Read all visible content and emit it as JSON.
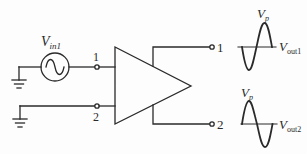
{
  "diagram": {
    "type": "amplifier-differential-output",
    "colors": {
      "stroke": "#2a2a2a",
      "background": "#fdfdfd"
    },
    "source": {
      "label_main": "V",
      "label_sub": "in1",
      "icon": "ac-sine-source"
    },
    "inputs": [
      {
        "label": "1"
      },
      {
        "label": "2"
      }
    ],
    "amplifier": {
      "shape": "triangle"
    },
    "outputs": [
      {
        "label": "1"
      },
      {
        "label": "2"
      }
    ],
    "waveforms": [
      {
        "peak_label_main": "V",
        "peak_label_sub": "p",
        "name_main": "V",
        "name_sub": "out1",
        "phase": "inverted"
      },
      {
        "peak_label_main": "V",
        "peak_label_sub": "p",
        "name_main": "V",
        "name_sub": "out2",
        "phase": "non-inverted"
      }
    ]
  }
}
